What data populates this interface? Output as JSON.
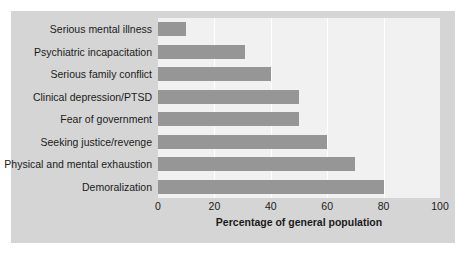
{
  "chart_data": {
    "type": "bar",
    "orientation": "horizontal",
    "title": "",
    "xlabel": "Percentage of general population",
    "ylabel": "",
    "xlim": [
      0,
      100
    ],
    "xticks": [
      "0",
      "20",
      "40",
      "60",
      "80",
      "100"
    ],
    "gridlines": [
      "20",
      "40",
      "60",
      "80"
    ],
    "grid": true,
    "legend": false,
    "categories": [
      "Serious mental illness",
      "Psychiatric incapacitation",
      "Serious family conflict",
      "Clinical depression/PTSD",
      "Fear of government",
      "Seeking justice/revenge",
      "Physical and mental exhaustion",
      "Demoralization"
    ],
    "values": [
      10,
      31,
      40,
      50,
      50,
      60,
      70,
      80
    ],
    "colors": {
      "bar": "#969696",
      "plot_background": "#f1f1f1",
      "panel_background": "#d5d5d5",
      "page_background": "#ffffff",
      "gridline": "#ffffff",
      "text": "#1b1b1b"
    }
  }
}
